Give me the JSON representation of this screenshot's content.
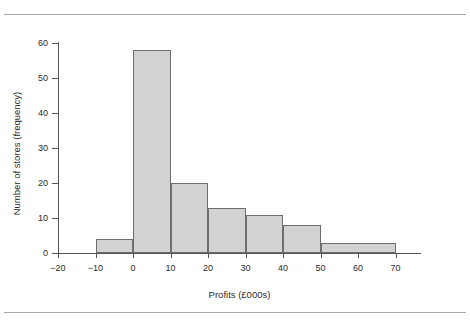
{
  "figure": {
    "background": "#ffffff",
    "rule_color": "#a8a8a8",
    "axis_color": "#555555",
    "bar_fill": "#d2d2d2",
    "bar_stroke": "#6e6e6e"
  },
  "chart_data": {
    "type": "bar",
    "title": "",
    "subtitle": "",
    "xlabel": "Profits (£000s)",
    "ylabel": "Number of stores (frequency)",
    "xlim": [
      -20,
      72
    ],
    "ylim": [
      0,
      62
    ],
    "grid": false,
    "legend": null,
    "xticks": [
      -20,
      -10,
      0,
      10,
      20,
      30,
      40,
      50,
      60,
      70
    ],
    "xticklabels": [
      "−20",
      "−10",
      "0",
      "10",
      "20",
      "30",
      "40",
      "50",
      "60",
      "70"
    ],
    "yticks": [
      0,
      10,
      20,
      30,
      40,
      50,
      60
    ],
    "yticklabels": [
      "0",
      "10",
      "20",
      "30",
      "40",
      "50",
      "60"
    ],
    "bins": [
      {
        "label": "-10 to 0",
        "start": -10,
        "end": 0,
        "value": 4
      },
      {
        "label": "0 to 10",
        "start": 0,
        "end": 10,
        "value": 58
      },
      {
        "label": "10 to 20",
        "start": 10,
        "end": 20,
        "value": 20
      },
      {
        "label": "20 to 30",
        "start": 20,
        "end": 30,
        "value": 13
      },
      {
        "label": "30 to 40",
        "start": 30,
        "end": 40,
        "value": 11
      },
      {
        "label": "40 to 50",
        "start": 40,
        "end": 50,
        "value": 8
      },
      {
        "label": "50 to 70",
        "start": 50,
        "end": 70,
        "value": 3
      }
    ],
    "categories": [
      "-10 to 0",
      "0 to 10",
      "10 to 20",
      "20 to 30",
      "30 to 40",
      "40 to 50",
      "50 to 70"
    ],
    "values": [
      4,
      58,
      20,
      13,
      11,
      8,
      3
    ]
  }
}
